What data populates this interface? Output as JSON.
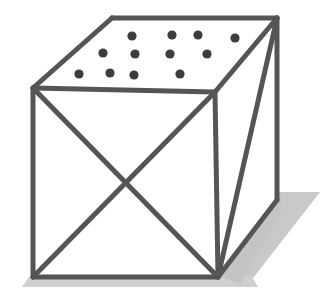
{
  "figure": {
    "title": "Wire-frame cube with dotted top face",
    "type": "line-drawing",
    "canvas": {
      "width": 329,
      "height": 294,
      "background": "#ffffff"
    },
    "style": {
      "edge_color": "#555555",
      "edge_highlight_color": "#6e6e6e",
      "edge_width": 5,
      "dot_color": "#3d3d3d",
      "dot_radius": 4.6,
      "shadow_color": "#c8c8c8",
      "face_fill": "#ffffff"
    },
    "vertices": {
      "front_top_left": {
        "x": 33,
        "y": 88
      },
      "front_top_right": {
        "x": 215,
        "y": 92
      },
      "front_bottom_left": {
        "x": 33,
        "y": 277
      },
      "front_bottom_right": {
        "x": 218,
        "y": 277
      },
      "back_top_left": {
        "x": 112,
        "y": 18
      },
      "back_top_right": {
        "x": 277,
        "y": 18
      },
      "back_bottom_right": {
        "x": 277,
        "y": 200
      },
      "x_center": {
        "x": 125,
        "y": 183
      }
    },
    "edges": [
      {
        "name": "front-face-top",
        "from": "front_top_left",
        "to": "front_top_right"
      },
      {
        "name": "front-face-left",
        "from": "front_top_left",
        "to": "front_bottom_left"
      },
      {
        "name": "front-face-bottom",
        "from": "front_bottom_left",
        "to": "front_bottom_right"
      },
      {
        "name": "front-face-right",
        "from": "front_top_right",
        "to": "front_bottom_right"
      },
      {
        "name": "top-face-left",
        "from": "front_top_left",
        "to": "back_top_left"
      },
      {
        "name": "top-face-back",
        "from": "back_top_left",
        "to": "back_top_right"
      },
      {
        "name": "top-face-right",
        "from": "back_top_right",
        "to": "front_top_right"
      },
      {
        "name": "right-face-vertical",
        "from": "back_top_right",
        "to": "back_bottom_right"
      },
      {
        "name": "right-face-bottom",
        "from": "back_bottom_right",
        "to": "front_bottom_right"
      },
      {
        "name": "right-face-diagonal",
        "from": "back_top_right",
        "to": "front_bottom_right"
      },
      {
        "name": "front-face-diagonal-a",
        "from": "front_top_left",
        "to": "front_bottom_right"
      },
      {
        "name": "front-face-diagonal-b",
        "from": "front_top_right",
        "to": "front_bottom_left"
      }
    ],
    "dots": {
      "count": 12,
      "rows": [
        {
          "row": 1,
          "points": [
            {
              "x": 132,
              "y": 36
            },
            {
              "x": 172,
              "y": 35
            },
            {
              "x": 198,
              "y": 35
            },
            {
              "x": 235,
              "y": 38
            }
          ]
        },
        {
          "row": 2,
          "points": [
            {
              "x": 103,
              "y": 53
            },
            {
              "x": 135,
              "y": 54
            },
            {
              "x": 170,
              "y": 54
            },
            {
              "x": 207,
              "y": 54
            }
          ]
        },
        {
          "row": 3,
          "points": [
            {
              "x": 79,
              "y": 74
            },
            {
              "x": 110,
              "y": 73
            },
            {
              "x": 134,
              "y": 75
            },
            {
              "x": 180,
              "y": 74
            }
          ]
        }
      ]
    },
    "shadow": {
      "name": "cast-shadow",
      "polygon": "33,279 222,279 318,186 281,186 281,202 220,280",
      "ground_strip": "30,277 224,277 224,285 28,285"
    }
  }
}
